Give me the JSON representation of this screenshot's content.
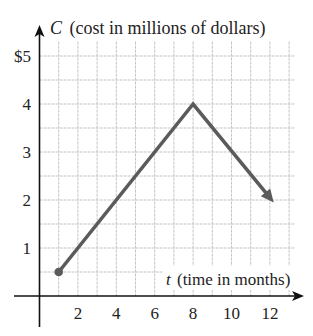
{
  "chart_data": {
    "type": "line",
    "title": "",
    "ylabel_var": "C",
    "ylabel_text": "(cost in millions of dollars)",
    "xlabel_var": "t",
    "xlabel_text": "(time in months)",
    "x": [
      1,
      8,
      12.2
    ],
    "series": [
      {
        "name": "C(t)",
        "values": [
          0.5,
          4,
          1.95
        ],
        "start_marker": "dot",
        "end_marker": "arrow"
      }
    ],
    "xlim": [
      0,
      13.3
    ],
    "ylim": [
      0,
      5.3
    ],
    "x_ticks": [
      2,
      4,
      6,
      8,
      10,
      12
    ],
    "x_tick_labels": [
      "2",
      "4",
      "6",
      "8",
      "10",
      "12"
    ],
    "y_ticks": [
      1,
      2,
      3,
      4,
      5
    ],
    "y_tick_labels": [
      "1",
      "2",
      "3",
      "4",
      "$5"
    ],
    "grid": {
      "on": true,
      "x_step": 1,
      "y_step": 0.5
    },
    "legend": null
  },
  "colors": {
    "line": "#5b5b5b",
    "grid": "#c4c4c4",
    "axis": "#111111"
  }
}
